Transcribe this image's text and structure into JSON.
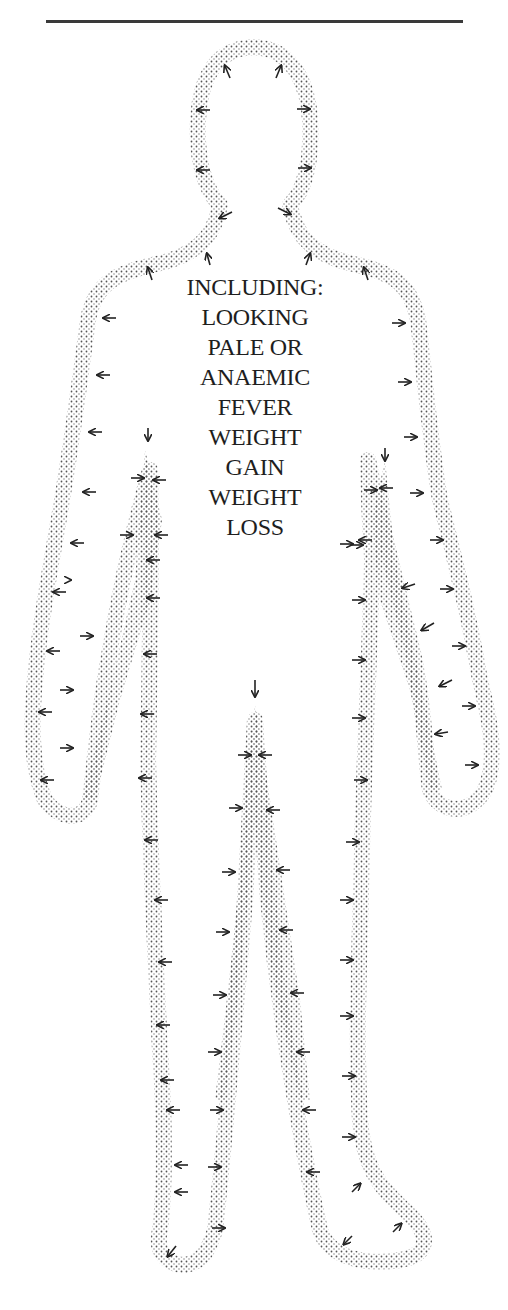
{
  "diagram": {
    "type": "body-outline-symptoms",
    "heading": "INCLUDING:",
    "symptoms": [
      "LOOKING",
      "PALE OR",
      "ANAEMIC",
      "FEVER",
      "WEIGHT",
      "GAIN",
      "WEIGHT",
      "LOSS"
    ],
    "symptom_items": [
      "Looking pale or anaemic",
      "Fever",
      "Weight gain",
      "Weight loss"
    ],
    "colors": {
      "outline_dots": "#555555",
      "arrows": "#222222",
      "text": "#1e1e1e",
      "rule": "#3a3a3a"
    }
  }
}
